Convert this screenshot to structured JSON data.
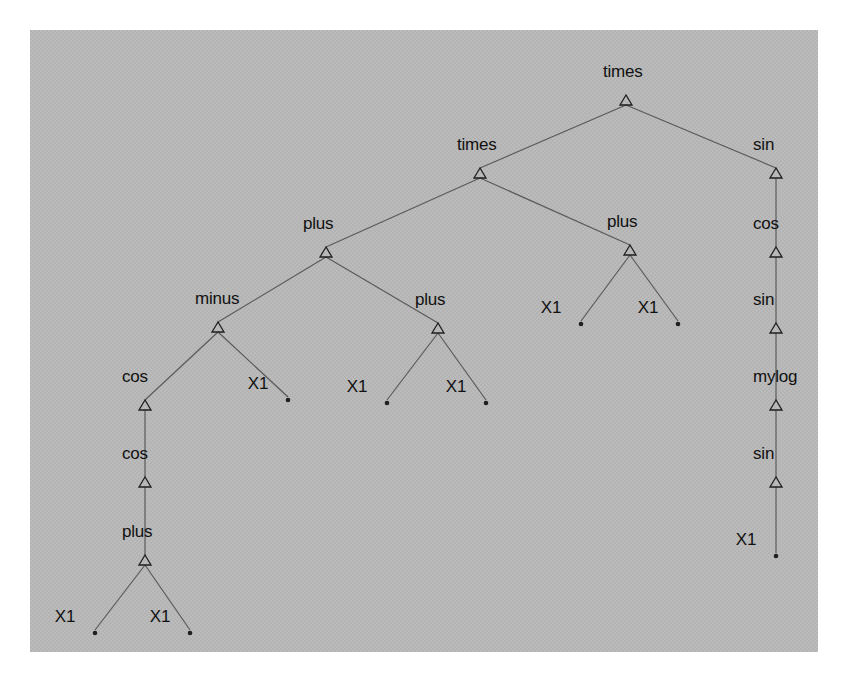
{
  "figure": {
    "title": "",
    "panel": {
      "x": 30,
      "y": 30,
      "width": 788,
      "height": 622,
      "background_color": "#b3b3b3"
    },
    "background_color": "#ffffff"
  },
  "chart_data": {
    "type": "diagram",
    "diagram_type": "expression-tree",
    "title": "",
    "xlabel": "",
    "ylabel": "",
    "grid": false,
    "legend": null,
    "node_marker": "hollow-triangle",
    "leaf_marker": "filled-dot",
    "edge_color": "#5a5a5a",
    "node_color": "#1f1f1f",
    "expression": "times(times(plus(minus(cos(cos(plus(X1, X1))), X1), plus(X1, X1)), plus(X1, X1)), sin(cos(sin(mylog(sin(X1))))))",
    "terminals": [
      "X1"
    ],
    "functions": [
      "times",
      "plus",
      "minus",
      "cos",
      "sin",
      "mylog"
    ],
    "nodes": [
      {
        "id": "n0",
        "label": "times",
        "kind": "function",
        "x": 596,
        "y": 70,
        "depth": 0
      },
      {
        "id": "n1",
        "label": "times",
        "kind": "function",
        "x": 450,
        "y": 143,
        "depth": 1
      },
      {
        "id": "n2",
        "label": "sin",
        "kind": "function",
        "x": 746,
        "y": 143,
        "depth": 1
      },
      {
        "id": "n3",
        "label": "plus",
        "kind": "function",
        "x": 296,
        "y": 222,
        "depth": 2
      },
      {
        "id": "n4",
        "label": "plus",
        "kind": "function",
        "x": 600,
        "y": 220,
        "depth": 2
      },
      {
        "id": "n5",
        "label": "cos",
        "kind": "function",
        "x": 746,
        "y": 222,
        "depth": 2
      },
      {
        "id": "n6",
        "label": "minus",
        "kind": "function",
        "x": 188,
        "y": 297,
        "depth": 3
      },
      {
        "id": "n7",
        "label": "plus",
        "kind": "function",
        "x": 408,
        "y": 298,
        "depth": 3
      },
      {
        "id": "n8",
        "label": "X1",
        "kind": "terminal",
        "x": 551,
        "y": 296,
        "depth": 3
      },
      {
        "id": "n9",
        "label": "X1",
        "kind": "terminal",
        "x": 648,
        "y": 296,
        "depth": 3
      },
      {
        "id": "n10",
        "label": "sin",
        "kind": "function",
        "x": 746,
        "y": 298,
        "depth": 3
      },
      {
        "id": "n11",
        "label": "cos",
        "kind": "function",
        "x": 115,
        "y": 375,
        "depth": 4
      },
      {
        "id": "n12",
        "label": "X1",
        "kind": "terminal",
        "x": 258,
        "y": 372,
        "depth": 4
      },
      {
        "id": "n13",
        "label": "X1",
        "kind": "terminal",
        "x": 357,
        "y": 375,
        "depth": 4
      },
      {
        "id": "n14",
        "label": "X1",
        "kind": "terminal",
        "x": 456,
        "y": 375,
        "depth": 4
      },
      {
        "id": "n15",
        "label": "mylog",
        "kind": "function",
        "x": 746,
        "y": 375,
        "depth": 4
      },
      {
        "id": "n16",
        "label": "cos",
        "kind": "function",
        "x": 115,
        "y": 452,
        "depth": 5
      },
      {
        "id": "n17",
        "label": "sin",
        "kind": "function",
        "x": 746,
        "y": 452,
        "depth": 5
      },
      {
        "id": "n18",
        "label": "plus",
        "kind": "function",
        "x": 115,
        "y": 530,
        "depth": 6
      },
      {
        "id": "n19",
        "label": "X1",
        "kind": "terminal",
        "x": 746,
        "y": 528,
        "depth": 6
      },
      {
        "id": "n20",
        "label": "X1",
        "kind": "terminal",
        "x": 65,
        "y": 605,
        "depth": 7
      },
      {
        "id": "n21",
        "label": "X1",
        "kind": "terminal",
        "x": 160,
        "y": 605,
        "depth": 7
      }
    ],
    "edges": [
      {
        "from": "n0",
        "to": "n1"
      },
      {
        "from": "n0",
        "to": "n2"
      },
      {
        "from": "n1",
        "to": "n3"
      },
      {
        "from": "n1",
        "to": "n4"
      },
      {
        "from": "n2",
        "to": "n5"
      },
      {
        "from": "n3",
        "to": "n6"
      },
      {
        "from": "n3",
        "to": "n7"
      },
      {
        "from": "n4",
        "to": "n8"
      },
      {
        "from": "n4",
        "to": "n9"
      },
      {
        "from": "n5",
        "to": "n10"
      },
      {
        "from": "n6",
        "to": "n11"
      },
      {
        "from": "n6",
        "to": "n12"
      },
      {
        "from": "n7",
        "to": "n13"
      },
      {
        "from": "n7",
        "to": "n14"
      },
      {
        "from": "n10",
        "to": "n15"
      },
      {
        "from": "n11",
        "to": "n16"
      },
      {
        "from": "n15",
        "to": "n17"
      },
      {
        "from": "n16",
        "to": "n18"
      },
      {
        "from": "n17",
        "to": "n19"
      },
      {
        "from": "n18",
        "to": "n20"
      },
      {
        "from": "n18",
        "to": "n21"
      }
    ]
  }
}
